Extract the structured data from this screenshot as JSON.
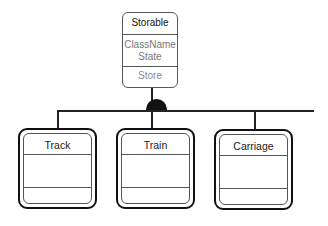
{
  "diagram": {
    "type": "UML class inheritance",
    "superclass": {
      "name": "Storable",
      "attributes": [
        "ClassName",
        "State"
      ],
      "operations": [
        "Store"
      ]
    },
    "subclasses": [
      {
        "name": "Track",
        "attributes": [],
        "operations": []
      },
      {
        "name": "Train",
        "attributes": [],
        "operations": []
      },
      {
        "name": "Carriage",
        "attributes": [],
        "operations": []
      }
    ],
    "relationship": "generalization (filled semicircle junction)"
  }
}
